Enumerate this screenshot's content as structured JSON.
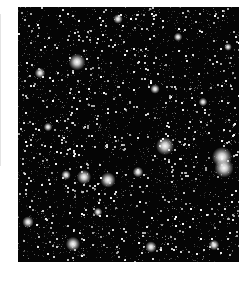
{
  "image": {
    "subject": "dense star field",
    "frame": {
      "x": 18,
      "y": 7,
      "width": 221,
      "height": 255
    },
    "background_color": "#050505",
    "page_background": "#ffffff",
    "star_color": "#ffffff",
    "faint_star_count": 2600,
    "bright_stars": [
      {
        "x": 59,
        "y": 55,
        "r": 3.5
      },
      {
        "x": 22,
        "y": 66,
        "r": 2.2
      },
      {
        "x": 137,
        "y": 82,
        "r": 2.0
      },
      {
        "x": 147,
        "y": 139,
        "r": 3.8
      },
      {
        "x": 204,
        "y": 150,
        "r": 4.2
      },
      {
        "x": 206,
        "y": 161,
        "r": 4.0
      },
      {
        "x": 66,
        "y": 170,
        "r": 3.0
      },
      {
        "x": 90,
        "y": 173,
        "r": 3.2
      },
      {
        "x": 48,
        "y": 168,
        "r": 2.0
      },
      {
        "x": 120,
        "y": 165,
        "r": 2.2
      },
      {
        "x": 55,
        "y": 237,
        "r": 3.0
      },
      {
        "x": 133,
        "y": 240,
        "r": 2.4
      },
      {
        "x": 196,
        "y": 238,
        "r": 2.2
      },
      {
        "x": 10,
        "y": 215,
        "r": 2.4
      },
      {
        "x": 100,
        "y": 12,
        "r": 2.0
      },
      {
        "x": 160,
        "y": 30,
        "r": 1.8
      },
      {
        "x": 185,
        "y": 95,
        "r": 1.8
      },
      {
        "x": 30,
        "y": 120,
        "r": 1.8
      },
      {
        "x": 210,
        "y": 40,
        "r": 1.6
      },
      {
        "x": 80,
        "y": 205,
        "r": 1.8
      }
    ]
  }
}
